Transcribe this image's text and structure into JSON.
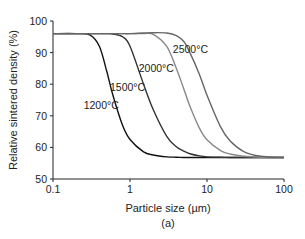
{
  "chart_data": {
    "type": "line",
    "title": "",
    "caption": "(a)",
    "xlabel": "Particle size (µm)",
    "ylabel": "Relative sintered density (%)",
    "xscale": "log",
    "xlim": [
      0.1,
      100
    ],
    "ylim": [
      50,
      100
    ],
    "xticks": [
      0.1,
      1,
      10,
      100
    ],
    "xtick_labels": [
      "0.1",
      "1",
      "10",
      "100"
    ],
    "yticks": [
      50,
      60,
      70,
      80,
      90,
      100
    ],
    "ytick_labels": [
      "50",
      "60",
      "70",
      "80",
      "90",
      "100"
    ],
    "grid": false,
    "legend": "inline labels",
    "x": [
      0.1,
      0.2,
      0.3,
      0.4,
      0.5,
      0.6,
      0.8,
      1,
      1.5,
      2,
      3,
      4,
      5,
      6,
      8,
      10,
      15,
      20,
      30,
      50,
      100
    ],
    "series": [
      {
        "name": "1200°C",
        "color": "#111111",
        "label_pos": [
          0.25,
          72
        ],
        "values": [
          96,
          96,
          95.6,
          92,
          84,
          76.5,
          67,
          62.5,
          58.6,
          57.6,
          57,
          56.9,
          56.8,
          56.8,
          56.8,
          56.8,
          56.8,
          56.8,
          56.8,
          56.8,
          56.8
        ]
      },
      {
        "name": "1500°C",
        "color": "#333333",
        "label_pos": [
          0.55,
          78
        ],
        "values": [
          96,
          96,
          96,
          96,
          96,
          95.9,
          95,
          92,
          80,
          72,
          63.5,
          60.2,
          58.8,
          58,
          57.3,
          57,
          56.9,
          56.8,
          56.8,
          56.8,
          56.8
        ]
      },
      {
        "name": "2000°C",
        "color": "#888888",
        "label_pos": [
          1.3,
          84
        ],
        "values": [
          96,
          96,
          96,
          96,
          96,
          96,
          96,
          96,
          96,
          95.8,
          92,
          85,
          78.5,
          73,
          66,
          62.4,
          59,
          57.9,
          57.2,
          56.9,
          56.8
        ]
      },
      {
        "name": "2500°C",
        "color": "#666666",
        "label_pos": [
          3.6,
          90
        ],
        "values": [
          96,
          96,
          96,
          96,
          96,
          96,
          96,
          96,
          96.2,
          96.3,
          96.2,
          95.4,
          93.5,
          90,
          83,
          76.5,
          66.5,
          62,
          58.7,
          57.2,
          56.8
        ]
      }
    ]
  }
}
